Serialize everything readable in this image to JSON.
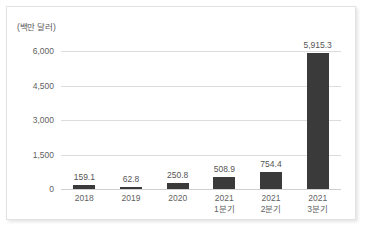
{
  "chart_data": {
    "type": "bar",
    "title": "",
    "subtitle": "",
    "xlabel": "",
    "ylabel": "(백만 달러)",
    "unit_label": "(백만 달러)",
    "categories": [
      {
        "line1": "2018",
        "line2": ""
      },
      {
        "line1": "2019",
        "line2": ""
      },
      {
        "line1": "2020",
        "line2": ""
      },
      {
        "line1": "2021",
        "line2": "1분기"
      },
      {
        "line1": "2021",
        "line2": "2분기"
      },
      {
        "line1": "2021",
        "line2": "3분기"
      }
    ],
    "values": [
      159.1,
      62.8,
      250.8,
      508.9,
      754.4,
      5915.3
    ],
    "value_labels": [
      "159.1",
      "62.8",
      "250.8",
      "508.9",
      "754.4",
      "5,915.3"
    ],
    "ylim": [
      0,
      6000
    ],
    "yticks": [
      0,
      1500,
      3000,
      4500,
      6000
    ],
    "ytick_labels": [
      "0",
      "1,500",
      "3,000",
      "4,500",
      "6,000"
    ],
    "grid": true,
    "legend": false,
    "bar_color": "#3a3a3a",
    "gridline_color": "#dcdcdc",
    "text_color": "#5f5f5f",
    "background_color": "#ffffff"
  }
}
